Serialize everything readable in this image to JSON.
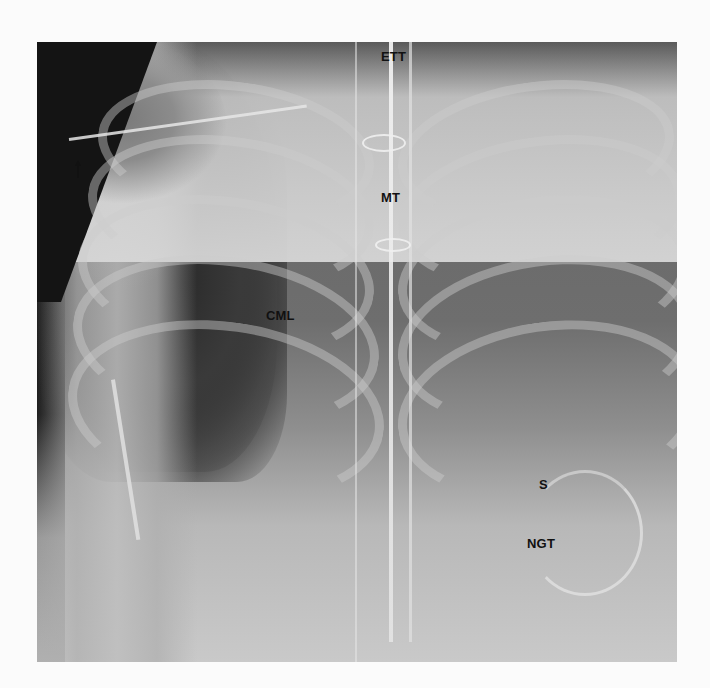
{
  "figure": {
    "type": "chest radiograph (frontal view)",
    "labels": [
      {
        "id": "ett",
        "text": "ETT",
        "x": 344,
        "y": 8
      },
      {
        "id": "mt",
        "text": "MT",
        "x": 344,
        "y": 149
      },
      {
        "id": "cml",
        "text": "CML",
        "x": 229,
        "y": 267
      },
      {
        "id": "s",
        "text": "S",
        "x": 502,
        "y": 436
      },
      {
        "id": "ngt",
        "text": "NGT",
        "x": 490,
        "y": 495
      }
    ],
    "arrow": {
      "direction": "up",
      "x": 38,
      "y": 118
    }
  }
}
